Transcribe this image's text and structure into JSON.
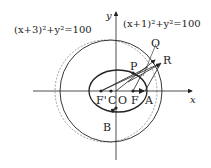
{
  "figure": {
    "circle_left_equation": "(x+3)²+y²=100",
    "circle_right_equation": "(x+1)²+y²=100",
    "axis_x_label": "x",
    "axis_y_label": "y",
    "points": {
      "F_prime": "F'",
      "C": "C",
      "O": "O",
      "F": "F",
      "A": "A",
      "P": "P",
      "Q": "Q",
      "R": "R",
      "B": "B"
    },
    "colors": {
      "ink": "#222222",
      "dashed_circle": "#777777"
    }
  }
}
